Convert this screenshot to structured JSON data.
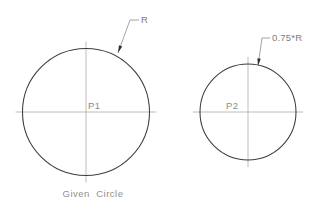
{
  "drawing": {
    "background_color": "#ffffff",
    "outline_color": "#3c3c3c",
    "centerline_color": "#b4b4b4",
    "leader_color": "#9a9a9a",
    "text_color": "#8a8a8a",
    "caption": "Given  Circle",
    "figures": [
      {
        "id": "given-circle",
        "center_label": "P1",
        "dimension_label": "R",
        "center_x": 86,
        "center_y": 112,
        "radius": 63.5,
        "centerline_overrun": 7,
        "caption": "Given  Circle",
        "leader": {
          "arrow_x": 118,
          "arrow_y": 53,
          "elbow_x": 130,
          "elbow_y": 20,
          "shelf_x": 139,
          "shelf_y": 20,
          "text_x": 141,
          "text_y": 23
        },
        "center_label_x": 88,
        "center_label_y": 109
      },
      {
        "id": "scaled-circle",
        "center_label": "P2",
        "dimension_label": "0.75*R",
        "center_x": 248,
        "center_y": 112,
        "radius": 48,
        "centerline_overrun": 7,
        "caption": "",
        "leader": {
          "arrow_x": 258,
          "arrow_y": 66,
          "elbow_x": 262,
          "elbow_y": 38,
          "shelf_x": 270,
          "shelf_y": 38,
          "text_x": 272,
          "text_y": 41
        },
        "center_label_x": 226,
        "center_label_y": 109
      }
    ],
    "caption_x": 93,
    "caption_y": 197
  }
}
